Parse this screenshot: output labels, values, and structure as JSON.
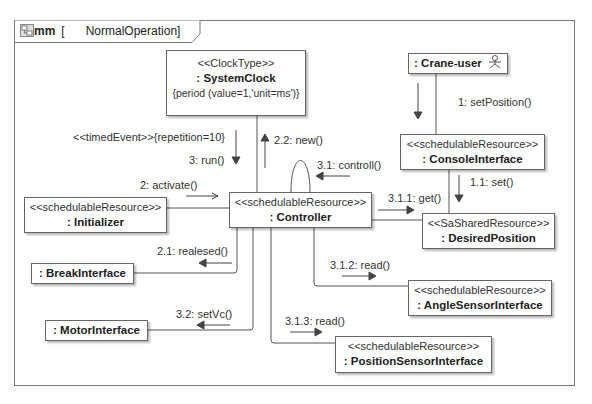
{
  "frame": {
    "kind": "comm",
    "name": "NormalOperation",
    "icon": "diagram-icon"
  },
  "nodes": {
    "system_clock": {
      "stereotype": "<<ClockType>>",
      "name": ": SystemClock",
      "constraint": "{period (value=1,'unit=ms')}"
    },
    "crane_user": {
      "name": ": Crane-user",
      "icon": "actor-icon"
    },
    "console_interface": {
      "stereotype": "<<schedulableResource>>",
      "name": ": ConsoleInterface"
    },
    "initializer": {
      "stereotype": "<<schedulableResource>>",
      "name": ": Initializer"
    },
    "controller": {
      "stereotype": "<<schedulableResource>>",
      "name": ": Controller"
    },
    "desired_position": {
      "stereotype": "<<SaSharedResource>>",
      "name": ": DesiredPosition"
    },
    "break_interface": {
      "name": ": BreakInterface"
    },
    "angle_sensor_interface": {
      "stereotype": "<<schedulableResource>>",
      "name": ": AngleSensorInterface"
    },
    "motor_interface": {
      "name": ": MotorInterface"
    },
    "position_sensor_interface": {
      "stereotype": "<<schedulableResource>>",
      "name": ": PositionSensorInterface"
    }
  },
  "messages": {
    "set_position": "1: setPosition()",
    "set": "1.1: set()",
    "timed_event": "<<timedEvent>>{repetition=10}",
    "run": "3: run()",
    "activate": "2: activate()",
    "new": "2.2: new()",
    "controll": "3.1: controll()",
    "get": "3.1.1: get()",
    "realesed": "2.1: realesed()",
    "read_angle": "3.1.2: read()",
    "set_vc": "3.2: setVc()",
    "read_position": "3.1.3: read()"
  }
}
